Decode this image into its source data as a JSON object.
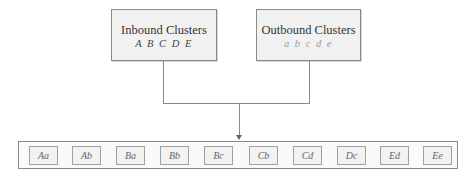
{
  "diagram": {
    "inbound": {
      "title": "Inbound Clusters",
      "members": "A B C D E"
    },
    "outbound": {
      "title": "Outbound Clusters",
      "members": "a b c d e"
    },
    "pairs": [
      {
        "label": "Aa",
        "x": 10
      },
      {
        "label": "Ab",
        "x": 53
      },
      {
        "label": "Ba",
        "x": 97
      },
      {
        "label": "Bb",
        "x": 141
      },
      {
        "label": "Bc",
        "x": 185
      },
      {
        "label": "Cb",
        "x": 230
      },
      {
        "label": "Cd",
        "x": 274
      },
      {
        "label": "Dc",
        "x": 318
      },
      {
        "label": "Ed",
        "x": 361
      },
      {
        "label": "Ee",
        "x": 404
      }
    ],
    "colors": {
      "box_fill": "#f1f1f1",
      "border": "#8a8a8a",
      "outbound_text": "#9a9a9a"
    }
  }
}
